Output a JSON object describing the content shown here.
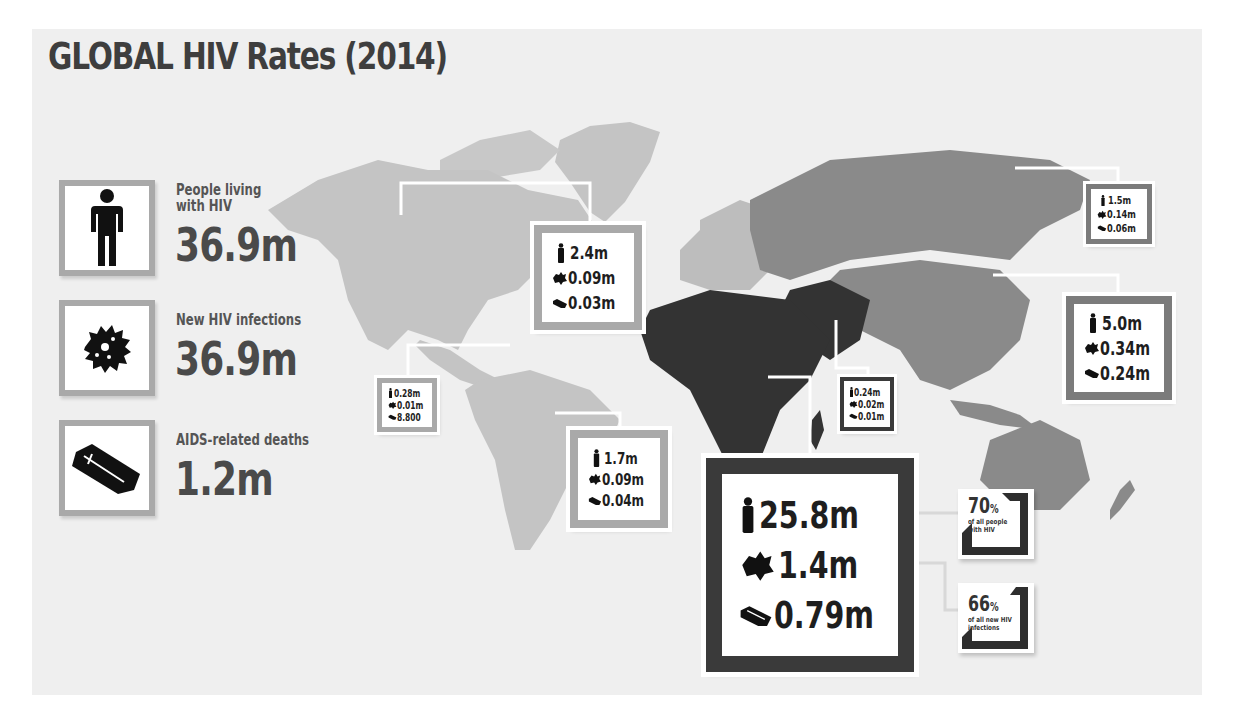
{
  "title": "GLOBAL HIV Rates (2014)",
  "colors": {
    "background": "#efefef",
    "title": "#3e3e3e",
    "land_low": "#c4c4c4",
    "land_europe": "#bdbdbd",
    "land_mid": "#8a8a8a",
    "land_high": "#333333",
    "box_frame_light": "#a9a9a9",
    "box_frame_mid": "#7b7b7b",
    "box_frame_dark": "#3a3a3a"
  },
  "global_stats": [
    {
      "icon": "person-icon",
      "label": "People living\nwith HIV",
      "value": "36.9m"
    },
    {
      "icon": "virus-icon",
      "label": "New HIV infections",
      "value": "36.9m"
    },
    {
      "icon": "coffin-icon",
      "label": "AIDS-related deaths",
      "value": "1.2m"
    }
  ],
  "regions": [
    {
      "name": "North America & Western/Central Europe",
      "living": "2.4m",
      "new": "0.09m",
      "deaths": "0.03m"
    },
    {
      "name": "Caribbean",
      "living": "0.28m",
      "new": "0.01m",
      "deaths": "8.800"
    },
    {
      "name": "Latin America",
      "living": "1.7m",
      "new": "0.09m",
      "deaths": "0.04m"
    },
    {
      "name": "Middle East & North Africa",
      "living": "0.24m",
      "new": "0.02m",
      "deaths": "0.01m"
    },
    {
      "name": "Eastern Europe & Central Asia",
      "living": "1.5m",
      "new": "0.14m",
      "deaths": "0.06m"
    },
    {
      "name": "Asia & Pacific",
      "living": "5.0m",
      "new": "0.34m",
      "deaths": "0.24m"
    },
    {
      "name": "Sub-Saharan Africa",
      "living": "25.8m",
      "new": "1.4m",
      "deaths": "0.79m"
    }
  ],
  "africa_shares": [
    {
      "value": "70",
      "unit": "%",
      "caption": "of all people with HIV"
    },
    {
      "value": "66",
      "unit": "%",
      "caption": "of all new HIV infections"
    }
  ]
}
